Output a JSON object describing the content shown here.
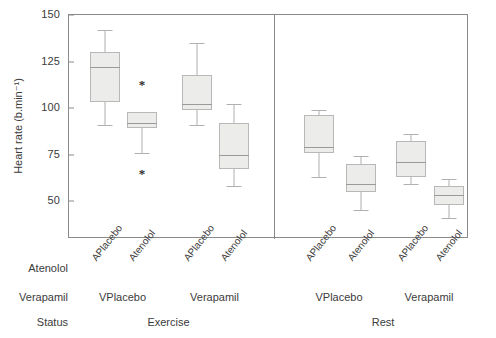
{
  "chart_data": {
    "type": "box",
    "title": "",
    "xlabel": "",
    "ylabel": "Heart rate (b.min⁻¹)",
    "ylim": [
      38,
      150
    ],
    "yticks": [
      50,
      75,
      100,
      125,
      150
    ],
    "grid": false,
    "legend": "none",
    "panels": [
      {
        "name": "Exercise",
        "label": "Exercise"
      },
      {
        "name": "Rest",
        "label": "Rest"
      }
    ],
    "row_headers": [
      "Atenolol",
      "Verapamil",
      "Status"
    ],
    "groups": [
      {
        "panel": "Exercise",
        "verapamil": "VPlacebo",
        "label": "Exercise / VPlacebo"
      },
      {
        "panel": "Exercise",
        "verapamil": "Verapamil",
        "label": "Exercise / Verapamil"
      },
      {
        "panel": "Rest",
        "verapamil": "VPlacebo",
        "label": "Rest / VPlacebo"
      },
      {
        "panel": "Rest",
        "verapamil": "Verapamil",
        "label": "Rest / Verapamil"
      }
    ],
    "boxes": [
      {
        "id": "ex-vplacebo-aplacebo",
        "atenolol": "APlacebo",
        "verapamil": "VPlacebo",
        "status": "Exercise",
        "whisker_low": 91,
        "q1": 103,
        "median": 122,
        "q3": 130,
        "whisker_high": 142
      },
      {
        "id": "ex-vplacebo-atenolol",
        "atenolol": "Atenolol",
        "verapamil": "VPlacebo",
        "status": "Exercise",
        "whisker_low": 76,
        "q1": 89,
        "median": 92,
        "q3": 98,
        "whisker_high": 98,
        "outliers_marked": [
          "*",
          "*"
        ]
      },
      {
        "id": "ex-verapamil-aplacebo",
        "atenolol": "APlacebo",
        "verapamil": "Verapamil",
        "status": "Exercise",
        "whisker_low": 91,
        "q1": 99,
        "median": 102,
        "q3": 118,
        "whisker_high": 135
      },
      {
        "id": "ex-verapamil-atenolol",
        "atenolol": "Atenolol",
        "verapamil": "Verapamil",
        "status": "Exercise",
        "whisker_low": 58,
        "q1": 67,
        "median": 75,
        "q3": 92,
        "whisker_high": 102
      },
      {
        "id": "rest-vplacebo-aplacebo",
        "atenolol": "APlacebo",
        "verapamil": "VPlacebo",
        "status": "Rest",
        "whisker_low": 63,
        "q1": 76,
        "median": 79,
        "q3": 96,
        "whisker_high": 99
      },
      {
        "id": "rest-vplacebo-atenolol",
        "atenolol": "Atenolol",
        "verapamil": "VPlacebo",
        "status": "Rest",
        "whisker_low": 45,
        "q1": 55,
        "median": 59,
        "q3": 70,
        "whisker_high": 74
      },
      {
        "id": "rest-verapamil-aplacebo",
        "atenolol": "APlacebo",
        "verapamil": "Verapamil",
        "status": "Rest",
        "whisker_low": 59,
        "q1": 63,
        "median": 71,
        "q3": 82,
        "whisker_high": 86
      },
      {
        "id": "rest-verapamil-atenolol",
        "atenolol": "Atenolol",
        "verapamil": "Verapamil",
        "status": "Rest",
        "whisker_low": 41,
        "q1": 48,
        "median": 53,
        "q3": 58,
        "whisker_high": 62
      }
    ],
    "annotations": [
      {
        "text": "*",
        "near_box": "ex-vplacebo-atenolol",
        "y": 113,
        "position": "above-box"
      },
      {
        "text": "*",
        "near_box": "ex-vplacebo-atenolol",
        "y": 65,
        "position": "below-whisker"
      }
    ],
    "colors": {
      "box_fill": "#ececeb",
      "box_edge": "#b8b8b8",
      "whisker": "#b0b0b0",
      "median": "#9a9a9a",
      "axis": "#8a8a8a",
      "text": "#3b3b3b"
    }
  },
  "axis": {
    "ytick_labels": [
      "150",
      "125",
      "100",
      "75",
      "50"
    ],
    "ylabel": "Heart rate (b.min⁻¹)"
  },
  "row_labels": {
    "atenolol": "Atenolol",
    "verapamil": "Verapamil",
    "status": "Status"
  },
  "atenolol_ticks": [
    "APlacebo",
    "Atenolol",
    "APlacebo",
    "Atenolol",
    "APlacebo",
    "Atenolol",
    "APlacebo",
    "Atenolol"
  ],
  "verapamil_ticks": [
    "VPlacebo",
    "Verapamil",
    "VPlacebo",
    "Verapamil"
  ],
  "status_ticks": [
    "Exercise",
    "Rest"
  ],
  "annotation_marks": [
    "*",
    "*"
  ]
}
